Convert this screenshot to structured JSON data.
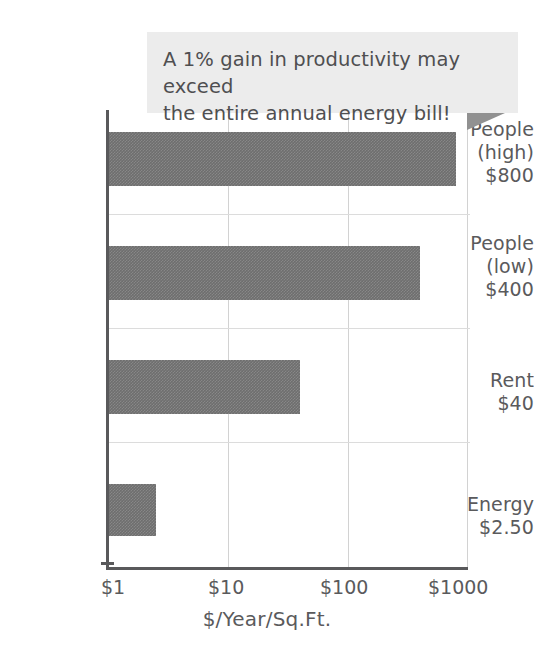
{
  "chart_data": {
    "type": "bar",
    "orientation": "horizontal",
    "title": "",
    "xlabel": "$/Year/Sq.Ft.",
    "ylabel": "",
    "xscale": "log",
    "xlim": [
      1,
      1000
    ],
    "xticks": [
      "$1",
      "$10",
      "$100",
      "$1000"
    ],
    "xtick_values": [
      1,
      10,
      100,
      1000
    ],
    "grid": "both",
    "legend": "none",
    "categories": [
      "People (high) $800",
      "People (low) $400",
      "Rent $40",
      "Energy $2.50"
    ],
    "values": [
      800,
      400,
      40,
      2.5
    ],
    "bar_color": "#6e6e6e",
    "annotations": [
      "A 1% gain in productivity may exceed the entire annual energy bill!"
    ]
  },
  "callout": {
    "line1": "A 1% gain in productivity may exceed",
    "line2": "the entire annual energy bill!",
    "background": "#ececec",
    "tail_color": "#919191"
  },
  "axis": {
    "x_title": "$/Year/Sq.Ft.",
    "ticks": [
      {
        "label": "$1"
      },
      {
        "label": "$10"
      },
      {
        "label": "$100"
      },
      {
        "label": "$1000"
      }
    ]
  },
  "bars": [
    {
      "name": "people-high",
      "line1": "People",
      "line2": "(high)",
      "line3": "$800",
      "value": 800
    },
    {
      "name": "people-low",
      "line1": "People",
      "line2": "(low)",
      "line3": "$400",
      "value": 400
    },
    {
      "name": "rent",
      "line1": "Rent",
      "line2": "$40",
      "line3": "",
      "value": 40
    },
    {
      "name": "energy",
      "line1": "Energy",
      "line2": "$2.50",
      "line3": "",
      "value": 2.5
    }
  ]
}
